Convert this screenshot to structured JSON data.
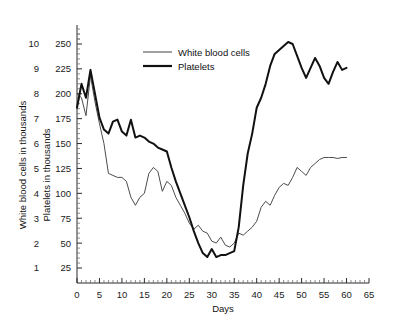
{
  "chart_data": {
    "type": "line",
    "title": "",
    "xlabel": "Days",
    "ylabel_left": "White blood cells in thousands",
    "ylabel_right_inner": "Platelets in thousands",
    "grid": false,
    "legend_position": "top-center",
    "xlim": [
      0,
      65
    ],
    "xticks": [
      0,
      5,
      10,
      15,
      20,
      25,
      30,
      35,
      40,
      45,
      50,
      55,
      60,
      65
    ],
    "x_minor_tick_step": 1,
    "axis_left": {
      "name": "White blood cells in thousands",
      "ylim": [
        0,
        10.5
      ],
      "yticks": [
        1,
        2,
        3,
        4,
        5,
        6,
        7,
        8,
        9,
        10
      ]
    },
    "axis_inner": {
      "name": "Platelets in thousands",
      "ylim": [
        0,
        262.5
      ],
      "yticks": [
        25,
        50,
        75,
        100,
        125,
        150,
        175,
        200,
        225,
        250
      ]
    },
    "legend": [
      {
        "label": "White blood cells",
        "color": "#8a8a8a",
        "width": "thin"
      },
      {
        "label": "Platelets",
        "color": "#111111",
        "width": "thick"
      }
    ],
    "series": [
      {
        "name": "White blood cells",
        "axis": "inner",
        "color": "#4c4c4c",
        "x": [
          0,
          1,
          2,
          3,
          4,
          5,
          6,
          7,
          8,
          9,
          10,
          11,
          12,
          13,
          14,
          15,
          16,
          17,
          18,
          19,
          20,
          21,
          22,
          23,
          24,
          25,
          26,
          27,
          28,
          29,
          30,
          31,
          32,
          33,
          34,
          35,
          36,
          37,
          38,
          39,
          40,
          41,
          42,
          43,
          44,
          45,
          46,
          47,
          48,
          49,
          50,
          51,
          52,
          53,
          54,
          55,
          56,
          57,
          58,
          59,
          60
        ],
        "values": [
          200,
          196,
          178,
          218,
          192,
          170,
          150,
          120,
          118,
          116,
          116,
          112,
          96,
          88,
          96,
          100,
          120,
          126,
          122,
          102,
          112,
          108,
          96,
          88,
          80,
          70,
          64,
          68,
          62,
          60,
          52,
          50,
          56,
          48,
          46,
          50,
          60,
          58,
          62,
          66,
          72,
          86,
          92,
          88,
          98,
          106,
          110,
          108,
          116,
          126,
          122,
          118,
          126,
          130,
          134,
          136,
          136,
          136,
          135,
          136,
          136
        ]
      },
      {
        "name": "Platelets",
        "axis": "inner",
        "color": "#111111",
        "x": [
          0,
          1,
          2,
          3,
          4,
          5,
          6,
          7,
          8,
          9,
          10,
          11,
          12,
          13,
          14,
          15,
          16,
          17,
          18,
          19,
          20,
          21,
          22,
          23,
          24,
          25,
          26,
          27,
          28,
          29,
          30,
          31,
          32,
          33,
          34,
          35,
          36,
          37,
          38,
          39,
          40,
          41,
          42,
          43,
          44,
          45,
          46,
          47,
          48,
          49,
          50,
          51,
          52,
          53,
          54,
          55,
          56,
          57,
          58,
          59,
          60
        ],
        "values": [
          186,
          210,
          196,
          224,
          200,
          176,
          164,
          160,
          172,
          174,
          162,
          158,
          174,
          156,
          158,
          156,
          152,
          150,
          146,
          144,
          142,
          126,
          112,
          100,
          88,
          76,
          62,
          50,
          40,
          36,
          44,
          36,
          38,
          38,
          40,
          42,
          66,
          108,
          140,
          160,
          186,
          196,
          210,
          228,
          240,
          244,
          248,
          252,
          250,
          238,
          226,
          216,
          226,
          236,
          228,
          216,
          210,
          222,
          232,
          224,
          226
        ]
      }
    ]
  },
  "legend": {
    "wbc_label": "White blood cells",
    "platelets_label": "Platelets"
  },
  "axes": {
    "x_title": "Days",
    "y_left_title": "White blood cells in thousands",
    "y_inner_title": "Platelets in thousands"
  },
  "ticks": {
    "x": [
      "0",
      "5",
      "10",
      "15",
      "20",
      "25",
      "30",
      "35",
      "40",
      "45",
      "50",
      "55",
      "60",
      "65"
    ],
    "y_left": [
      "1",
      "2",
      "3",
      "4",
      "5",
      "6",
      "7",
      "8",
      "9",
      "10"
    ],
    "y_inner": [
      "25",
      "50",
      "75",
      "100",
      "125",
      "150",
      "175",
      "200",
      "225",
      "250"
    ]
  },
  "colors": {
    "wbc_line": "#4c4c4c",
    "platelets_line": "#111111",
    "axis": "#2b2b2b",
    "background": "#ffffff"
  }
}
